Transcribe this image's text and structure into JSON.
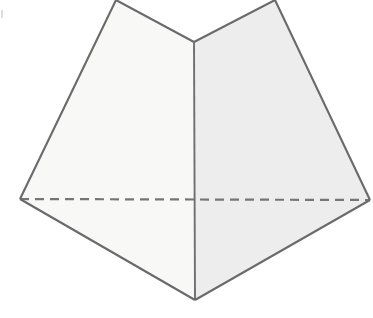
{
  "figure": {
    "canvas": {
      "width": 373,
      "height": 318,
      "background": "#ffffff"
    },
    "style": {
      "left_face_fill": "#f8f8f7",
      "right_face_fill": "#ededed",
      "edge_stroke": "#6a6a6a",
      "hidden_edge_stroke": "#757575",
      "edge_width": 2.1,
      "hidden_dash_pattern": "9 6"
    },
    "vertices": {
      "top_left_apex": {
        "x": 116,
        "y": 0
      },
      "top_right_apex": {
        "x": 275,
        "y": 0
      },
      "notch_center": {
        "x": 194,
        "y": 42
      },
      "left": {
        "x": 20,
        "y": 199
      },
      "right": {
        "x": 370,
        "y": 200
      },
      "bottom": {
        "x": 195,
        "y": 300
      }
    },
    "faces": [
      {
        "name": "left-face",
        "label": "Left shaded face",
        "fill": "#f8f8f7",
        "points": "116,0 194,42 195,300 20,199"
      },
      {
        "name": "right-face",
        "label": "Right shaded face",
        "fill": "#ededed",
        "points": "194,42 275,0 370,200 195,300"
      }
    ],
    "edges": [
      {
        "name": "edge-top-left-notch",
        "visible": true,
        "points": "116,0 194,42"
      },
      {
        "name": "edge-notch-top-right",
        "visible": true,
        "points": "194,42 275,0"
      },
      {
        "name": "edge-top-left-to-left",
        "visible": true,
        "points": "116,0 20,199"
      },
      {
        "name": "edge-top-right-to-right",
        "visible": true,
        "points": "275,0 370,200"
      },
      {
        "name": "edge-left-to-bottom",
        "visible": true,
        "points": "20,199 195,300"
      },
      {
        "name": "edge-right-to-bottom",
        "visible": true,
        "points": "370,200 195,300"
      },
      {
        "name": "edge-central-vertical",
        "visible": true,
        "points": "194,42 195,300"
      }
    ],
    "hidden_edge": {
      "name": "hidden-edge-horizontal",
      "label": "Dashed hidden edge",
      "points": "20,199 370,200"
    },
    "artifacts": [
      {
        "name": "scan-speck",
        "x": 1,
        "y": 10,
        "width": 2,
        "height": 8,
        "color": "#d8d8d8"
      }
    ]
  }
}
